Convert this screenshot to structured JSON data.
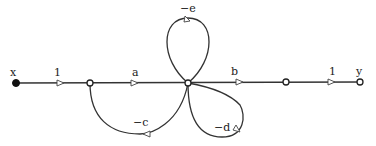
{
  "diagram": {
    "type": "signal-flow-graph",
    "input_label": "x",
    "output_label": "y",
    "nodes": [
      {
        "id": "x",
        "label": "x",
        "filled": true
      },
      {
        "id": "n1",
        "label": ""
      },
      {
        "id": "n2",
        "label": ""
      },
      {
        "id": "n3",
        "label": ""
      },
      {
        "id": "y",
        "label": "y"
      }
    ],
    "branches": [
      {
        "from": "x",
        "to": "n1",
        "gain": "1"
      },
      {
        "from": "n1",
        "to": "n2",
        "gain": "a"
      },
      {
        "from": "n2",
        "to": "n3",
        "gain": "b"
      },
      {
        "from": "n3",
        "to": "y",
        "gain": "1"
      },
      {
        "from": "n2",
        "to": "n2",
        "gain": "−e",
        "kind": "self-loop-top"
      },
      {
        "from": "n2",
        "to": "n2",
        "gain": "−d",
        "kind": "self-loop-bottom"
      },
      {
        "from": "n2",
        "to": "n1",
        "gain": "−c",
        "kind": "feedback"
      }
    ]
  }
}
